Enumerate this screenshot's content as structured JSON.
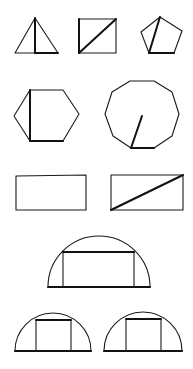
{
  "figure": {
    "width": 193,
    "height": 369,
    "stroke_color": "#1a1a1a",
    "background": "#ffffff",
    "shapes": [
      {
        "id": "triangle",
        "type": "polygon",
        "points": [
          [
            35,
            18
          ],
          [
            58,
            53
          ],
          [
            15,
            53
          ]
        ],
        "emphasis_lines": [
          [
            [
              35,
              18
            ],
            [
              35,
              53
            ]
          ],
          [
            [
              35,
              53
            ],
            [
              58,
              53
            ]
          ]
        ]
      },
      {
        "id": "square",
        "type": "polygon",
        "points": [
          [
            79,
            19
          ],
          [
            116,
            19
          ],
          [
            116,
            53
          ],
          [
            79,
            53
          ]
        ],
        "emphasis_lines": [
          [
            [
              79,
              53
            ],
            [
              116,
              19
            ]
          ],
          [
            [
              79,
              19
            ],
            [
              79,
              53
            ]
          ]
        ]
      },
      {
        "id": "pentagon",
        "type": "polygon",
        "points": [
          [
            160,
            17
          ],
          [
            182,
            31
          ],
          [
            174,
            53
          ],
          [
            149,
            53
          ],
          [
            141,
            32
          ]
        ],
        "emphasis_lines": [
          [
            [
              160,
              17
            ],
            [
              149,
              53
            ]
          ],
          [
            [
              149,
              53
            ],
            [
              174,
              53
            ]
          ]
        ]
      },
      {
        "id": "hexagon",
        "type": "polygon",
        "points": [
          [
            14,
            116
          ],
          [
            30,
            90
          ],
          [
            63,
            90
          ],
          [
            79,
            114
          ],
          [
            63,
            141
          ],
          [
            30,
            141
          ]
        ],
        "emphasis_lines": [
          [
            [
              30,
              90
            ],
            [
              30,
              141
            ]
          ],
          [
            [
              30,
              141
            ],
            [
              63,
              141
            ]
          ]
        ]
      },
      {
        "id": "decagon",
        "type": "polygon",
        "points": [
          [
            130,
            81
          ],
          [
            154,
            81
          ],
          [
            172,
            92
          ],
          [
            179,
            114
          ],
          [
            172,
            136
          ],
          [
            154,
            148
          ],
          [
            131,
            148
          ],
          [
            113,
            136
          ],
          [
            105,
            114
          ],
          [
            112,
            92
          ]
        ],
        "emphasis_lines": [
          [
            [
              142,
              116
            ],
            [
              131,
              148
            ]
          ],
          [
            [
              131,
              148
            ],
            [
              154,
              148
            ]
          ]
        ]
      },
      {
        "id": "rectangle",
        "type": "polygon",
        "points": [
          [
            16,
            176
          ],
          [
            86,
            175
          ],
          [
            86,
            210
          ],
          [
            16,
            210
          ]
        ],
        "emphasis_lines": []
      },
      {
        "id": "rectangle-diagonal",
        "type": "polygon",
        "points": [
          [
            111,
            175
          ],
          [
            183,
            175
          ],
          [
            183,
            210
          ],
          [
            111,
            210
          ]
        ],
        "emphasis_lines": [
          [
            [
              111,
              210
            ],
            [
              183,
              175
            ]
          ]
        ]
      },
      {
        "id": "semicircle-large",
        "type": "semicircle",
        "cx": 99,
        "cy": 287,
        "r": 51,
        "inscribed_rect": [
          [
            63,
            252
          ],
          [
            134,
            252
          ],
          [
            134,
            287
          ],
          [
            63,
            287
          ]
        ]
      },
      {
        "id": "semicircle-small-left",
        "type": "semicircle",
        "cx": 53,
        "cy": 351,
        "r": 38,
        "inscribed_rect": [
          [
            36,
            320
          ],
          [
            71,
            320
          ],
          [
            71,
            351
          ],
          [
            36,
            351
          ]
        ]
      },
      {
        "id": "semicircle-small-right",
        "type": "semicircle",
        "cx": 143,
        "cy": 351,
        "r": 39,
        "inscribed_rect": [
          [
            126,
            319
          ],
          [
            161,
            319
          ],
          [
            161,
            351
          ],
          [
            126,
            351
          ]
        ]
      }
    ]
  }
}
